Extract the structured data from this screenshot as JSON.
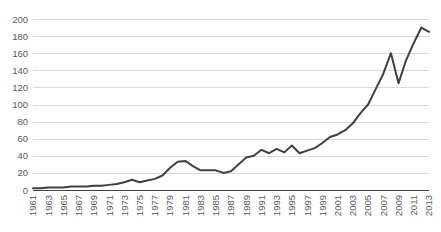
{
  "chart_data": {
    "type": "line",
    "title": "",
    "subtitle": "",
    "xlabel": "",
    "ylabel": "",
    "ylim": [
      0,
      200
    ],
    "yticks": [
      0,
      20,
      40,
      60,
      80,
      100,
      120,
      140,
      160,
      180,
      200
    ],
    "ytick_labels": [
      "0",
      "20",
      "40",
      "60",
      "80",
      "100",
      "120",
      "140",
      "160",
      "180",
      "200"
    ],
    "xlim": [
      1961,
      2013
    ],
    "xticks": [
      1961,
      1963,
      1965,
      1967,
      1969,
      1971,
      1973,
      1975,
      1977,
      1979,
      1981,
      1983,
      1985,
      1987,
      1989,
      1991,
      1993,
      1995,
      1997,
      1999,
      2001,
      2003,
      2005,
      2007,
      2009,
      2011,
      2013
    ],
    "xtick_labels": [
      "1961",
      "1963",
      "1965",
      "1967",
      "1969",
      "1971",
      "1973",
      "1975",
      "1977",
      "1979",
      "1981",
      "1983",
      "1985",
      "1987",
      "1989",
      "1991",
      "1993",
      "1995",
      "1997",
      "1999",
      "2001",
      "2003",
      "2005",
      "2007",
      "2009",
      "2011",
      "2013"
    ],
    "xtick_rotation": -90,
    "grid": "horizontal",
    "legend": "none",
    "line_color": "#404040",
    "grid_color": "#d9d9d9",
    "axis_color": "#404040",
    "tick_label_color": "#595959",
    "x": [
      1961,
      1962,
      1963,
      1964,
      1965,
      1966,
      1967,
      1968,
      1969,
      1970,
      1971,
      1972,
      1973,
      1974,
      1975,
      1976,
      1977,
      1978,
      1979,
      1980,
      1981,
      1982,
      1983,
      1984,
      1985,
      1986,
      1987,
      1988,
      1989,
      1990,
      1991,
      1992,
      1993,
      1994,
      1995,
      1996,
      1997,
      1998,
      1999,
      2000,
      2001,
      2002,
      2003,
      2004,
      2005,
      2006,
      2007,
      2008,
      2009,
      2010,
      2011,
      2012,
      2013
    ],
    "series": [
      {
        "name": "value",
        "values": [
          2,
          2,
          3,
          3,
          3,
          4,
          4,
          4,
          5,
          5,
          6,
          7,
          9,
          12,
          9,
          11,
          13,
          17,
          26,
          33,
          34,
          28,
          23,
          23,
          23,
          20,
          22,
          30,
          38,
          40,
          47,
          43,
          48,
          44,
          52,
          43,
          46,
          49,
          55,
          62,
          65,
          70,
          78,
          90,
          100,
          118,
          136,
          160,
          125,
          152,
          172,
          190,
          185
        ]
      }
    ]
  },
  "plot_geometry": {
    "left": 33,
    "right": 429,
    "top": 19,
    "bottom": 190
  }
}
